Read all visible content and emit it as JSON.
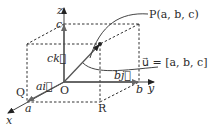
{
  "diagram": {
    "axes": {
      "x_label": "x",
      "y_label": "y",
      "z_label": "z",
      "origin_label": "O"
    },
    "intercepts": {
      "a_label": "a",
      "b_label": "b",
      "c_label": "c"
    },
    "components": {
      "ai_label": "ai⃗",
      "bj_label": "bj⃗",
      "ck_label": "ck⃗"
    },
    "points": {
      "P_label": "P(a, b, c)",
      "Q_label": "Q",
      "R_label": "R"
    },
    "vector_label": "u⃗ = [a, b, c]"
  }
}
